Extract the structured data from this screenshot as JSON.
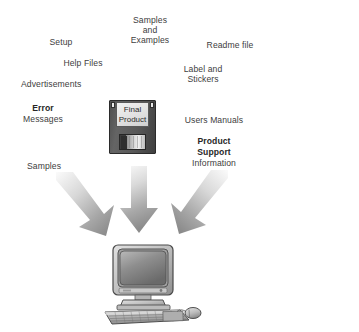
{
  "diagram": {
    "title_present": false,
    "center_object": {
      "name": "floppy-disk",
      "label_line1": "Final",
      "label_line2": "Product"
    },
    "target_object": {
      "name": "desktop-computer"
    },
    "labels": [
      {
        "id": "setup",
        "text": "Setup",
        "bold": false,
        "x": 61,
        "y": 37,
        "align": "center"
      },
      {
        "id": "samples-and-examples",
        "text": "Samples\nand\nExamples",
        "bold": false,
        "x": 150,
        "y": 15,
        "align": "center"
      },
      {
        "id": "readme-file",
        "text": "Readme file",
        "bold": false,
        "x": 230,
        "y": 40,
        "align": "center"
      },
      {
        "id": "help-files",
        "text": "Help Files",
        "bold": false,
        "x": 83,
        "y": 58,
        "align": "center"
      },
      {
        "id": "label-and-stickers",
        "text": "Label and\nStickers",
        "bold": false,
        "x": 203,
        "y": 64,
        "align": "center"
      },
      {
        "id": "advertisements",
        "text": "Advertisements",
        "bold": false,
        "x": 21,
        "y": 79,
        "align": "left"
      },
      {
        "id": "error",
        "text": "Error",
        "bold": true,
        "x": 43,
        "y": 103,
        "align": "center"
      },
      {
        "id": "messages",
        "text": "Messages",
        "bold": false,
        "x": 43,
        "y": 114,
        "align": "center"
      },
      {
        "id": "users-manuals",
        "text": "Users Manuals",
        "bold": false,
        "x": 214,
        "y": 115,
        "align": "center"
      },
      {
        "id": "product",
        "text": "Product",
        "bold": true,
        "x": 214,
        "y": 136,
        "align": "center"
      },
      {
        "id": "support",
        "text": "Support",
        "bold": true,
        "x": 214,
        "y": 147,
        "align": "center"
      },
      {
        "id": "information",
        "text": "Information",
        "bold": false,
        "x": 214,
        "y": 158,
        "align": "center"
      },
      {
        "id": "samples",
        "text": "Samples",
        "bold": false,
        "x": 44,
        "y": 161,
        "align": "center"
      }
    ],
    "arrows": [
      {
        "id": "arrow-left",
        "direction": "down-right",
        "fill_from": "#f2f2f2",
        "fill_to": "#8c8c8c"
      },
      {
        "id": "arrow-center",
        "direction": "down",
        "fill_from": "#f2f2f2",
        "fill_to": "#8c8c8c"
      },
      {
        "id": "arrow-right",
        "direction": "down-left",
        "fill_from": "#f2f2f2",
        "fill_to": "#8c8c8c"
      }
    ],
    "colors": {
      "background": "#ffffff",
      "text": "#404040",
      "text_bold": "#262626",
      "floppy_body": "#585858",
      "floppy_label": "#e4e4e4",
      "arrow_light": "#f2f2f2",
      "arrow_dark": "#8c8c8c",
      "computer_light": "#d4d4d4",
      "computer_mid": "#9a9a9a",
      "computer_dark": "#4a4a4a"
    }
  }
}
